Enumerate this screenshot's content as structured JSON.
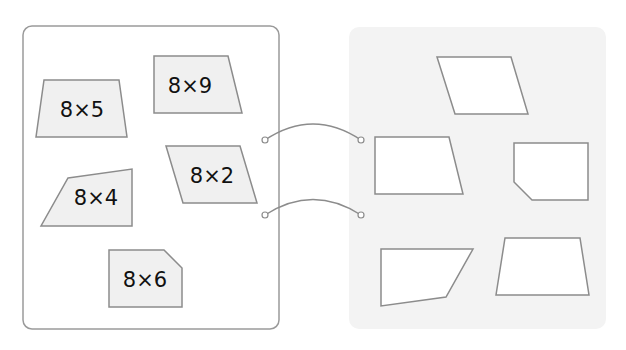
{
  "colors": {
    "left_panel_border": "#9a9a9a",
    "left_panel_fill": "#ffffff",
    "right_panel_fill": "#f3f3f3",
    "card_fill": "#f0f0f0",
    "shape_stroke": "#8c8c8c",
    "target_fill": "#ffffff",
    "connector": "#8c8c8c",
    "text": "#111111"
  },
  "left_panel": {
    "cards": [
      {
        "id": "card-8x5",
        "label": "8×5",
        "points": "44,80 119,80 127,137 36,137",
        "text_x": 82,
        "text_y": 117
      },
      {
        "id": "card-8x9",
        "label": "8×9",
        "points": "154,56 228,56 242,113 154,113",
        "text_x": 190,
        "text_y": 93
      },
      {
        "id": "card-8x2",
        "label": "8×2",
        "points": "166,146 240,146 257,203 183,203",
        "text_x": 212,
        "text_y": 183
      },
      {
        "id": "card-8x4",
        "label": "8×4",
        "points": "68,178 132,169 132,226 41,226",
        "text_x": 96,
        "text_y": 205
      },
      {
        "id": "card-8x6",
        "label": "8×6",
        "points": "109,250 164,250 182,268 182,307 109,307",
        "text_x": 145,
        "text_y": 287
      }
    ]
  },
  "right_panel": {
    "targets": [
      {
        "id": "target-parallelogram",
        "points": "437,57 511,57 528,114 455,114"
      },
      {
        "id": "target-right-trapezoid",
        "points": "375,137 449,137 463,194 375,194"
      },
      {
        "id": "target-pentagon",
        "points": "514,143 588,143 588,200 532,200 514,182"
      },
      {
        "id": "target-quadrilateral",
        "points": "381,249 473,249 446,297 381,306"
      },
      {
        "id": "target-trapezoid",
        "points": "505,238 580,238 589,295 496,295"
      }
    ]
  },
  "connectors": [
    {
      "id": "connector-1",
      "path": "M 265 140 Q 313 108 361 140",
      "left_dot": [
        265,
        140
      ],
      "right_dot": [
        361,
        140
      ]
    },
    {
      "id": "connector-2",
      "path": "M 265 215 Q 313 184 361 215",
      "left_dot": [
        265,
        215
      ],
      "right_dot": [
        361,
        215
      ]
    }
  ]
}
